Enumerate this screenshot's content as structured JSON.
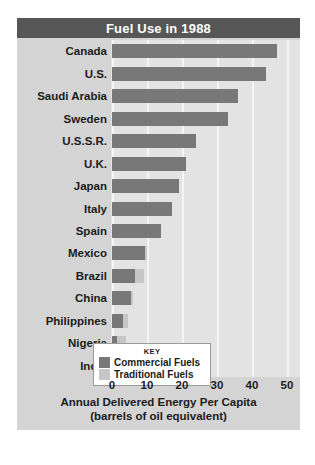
{
  "title": "Fuel Use in 1988",
  "legend": {
    "heading": "KEY",
    "items": [
      {
        "label": "Commercial Fuels",
        "color": "#787878"
      },
      {
        "label": "Traditional Fuels",
        "color": "#c6c6c6"
      }
    ]
  },
  "axis": {
    "title_line1": "Annual Delivered Energy Per Capita",
    "title_line2": "(barrels of oil equivalent)",
    "ticks": [
      "0",
      "10",
      "20",
      "30",
      "40",
      "50"
    ]
  },
  "chart_data": {
    "type": "bar",
    "orientation": "horizontal",
    "stacked": true,
    "title": "Fuel Use in 1988",
    "xlabel": "Annual Delivered Energy Per Capita (barrels of oil equivalent)",
    "ylabel": "",
    "xlim": [
      0,
      50
    ],
    "xticks": [
      0,
      10,
      20,
      30,
      40,
      50
    ],
    "grid": true,
    "legend_position": "inside-bottom-right",
    "categories": [
      "Canada",
      "U.S.",
      "Saudi Arabia",
      "Sweden",
      "U.S.S.R.",
      "U.K.",
      "Japan",
      "Italy",
      "Spain",
      "Mexico",
      "Brazil",
      "China",
      "Philippines",
      "Nigeria",
      "India"
    ],
    "series": [
      {
        "name": "Commercial Fuels",
        "color": "#787878",
        "values": [
          47,
          44,
          36,
          33,
          24,
          21,
          19,
          17,
          14,
          9.5,
          6.5,
          5.5,
          3,
          1.5,
          1.5
        ]
      },
      {
        "name": "Traditional Fuels",
        "color": "#c6c6c6",
        "values": [
          0,
          0,
          0,
          0,
          0,
          0,
          0,
          0,
          0,
          0.5,
          2.5,
          0.5,
          1.5,
          2.5,
          2
        ]
      }
    ]
  },
  "colors": {
    "title_bar": "#575757",
    "panel": "#d4d4d4",
    "plot_background": "#e3e3e3",
    "gridline": "#f4f4f4",
    "text": "#1c1c1c"
  }
}
